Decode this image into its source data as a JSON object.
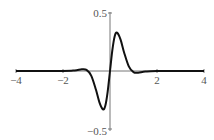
{
  "chart_data": {
    "type": "line",
    "title": "",
    "xlabel": "",
    "ylabel": "",
    "xlim": [
      -4,
      4
    ],
    "ylim": [
      -0.5,
      0.5
    ],
    "x_ticks": [
      "-4",
      "-2",
      "2",
      "4"
    ],
    "y_ticks": [
      "0.5",
      "-0.5"
    ],
    "grid": false,
    "series": [
      {
        "name": "f(x)",
        "x": [
          -4,
          -2,
          -1.5,
          -1.2,
          -1.0,
          -0.8,
          -0.6,
          -0.45,
          -0.3,
          -0.2,
          -0.1,
          0,
          0.1,
          0.2,
          0.3,
          0.45,
          0.6,
          0.8,
          1.0,
          1.2,
          1.5,
          2,
          4
        ],
        "y": [
          0,
          0,
          0.005,
          0.015,
          0.01,
          -0.04,
          -0.16,
          -0.27,
          -0.33,
          -0.3,
          -0.18,
          0,
          0.18,
          0.3,
          0.33,
          0.27,
          0.16,
          0.04,
          -0.01,
          -0.015,
          -0.005,
          0,
          0
        ]
      }
    ]
  }
}
